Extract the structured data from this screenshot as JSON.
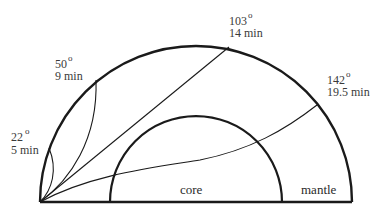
{
  "diagram": {
    "title": "",
    "regions": {
      "core": "core",
      "mantle": "mantle"
    },
    "rays": [
      {
        "angle": "22",
        "degree_symbol": "o",
        "time": "5 min"
      },
      {
        "angle": "50",
        "degree_symbol": "o",
        "time": "9 min"
      },
      {
        "angle": "103",
        "degree_symbol": "o",
        "time": "14 min"
      },
      {
        "angle": "142",
        "degree_symbol": "o",
        "time": "19.5 min"
      }
    ],
    "colors": {
      "stroke": "#1a1a1a",
      "text": "#3a3a3a",
      "background": "#ffffff"
    }
  }
}
